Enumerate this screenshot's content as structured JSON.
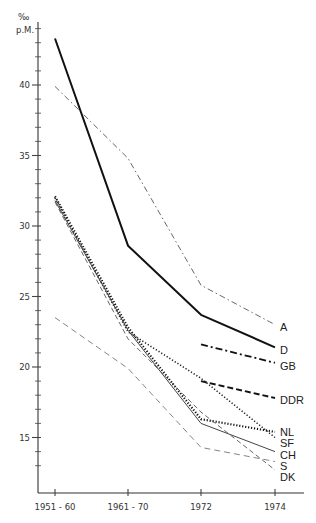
{
  "chart_data": {
    "type": "line",
    "title": "",
    "ylabel": "‰ p.M.",
    "ylabel_line1": "‰",
    "ylabel_line2": "p.M.",
    "xlabel": "",
    "categories": [
      "1951 - 60",
      "1961 - 70",
      "1972",
      "1974"
    ],
    "ylim": [
      11.7,
      46.5
    ],
    "yticks_major": [
      15,
      20,
      25,
      30,
      35,
      40
    ],
    "ytick_minor_step": 1,
    "grid": false,
    "legend_position": "right-end labels",
    "series": [
      {
        "name": "A",
        "style": "dash-dot-thin",
        "values": [
          39.9,
          34.8,
          25.8,
          23.0
        ]
      },
      {
        "name": "D",
        "style": "solid-thick",
        "values": [
          43.3,
          28.6,
          23.7,
          21.4
        ]
      },
      {
        "name": "GB",
        "style": "dash-dot-thick",
        "values": [
          null,
          null,
          21.6,
          20.3
        ]
      },
      {
        "name": "DDR",
        "style": "dashed-thick",
        "values": [
          null,
          null,
          19.0,
          17.8
        ]
      },
      {
        "name": "NL",
        "style": "dotted-thick",
        "values": [
          32.1,
          22.8,
          16.3,
          15.4
        ]
      },
      {
        "name": "SF",
        "style": "dotted",
        "values": [
          32.0,
          22.5,
          19.2,
          15.0
        ]
      },
      {
        "name": "CH",
        "style": "solid-thin",
        "values": [
          31.8,
          22.6,
          16.0,
          14.0
        ]
      },
      {
        "name": "S",
        "style": "dashed-thin",
        "values": [
          31.7,
          22.0,
          16.8,
          12.7
        ]
      },
      {
        "name": "DK",
        "style": "dashed-light",
        "values": [
          23.5,
          19.9,
          14.3,
          13.3
        ]
      }
    ]
  },
  "axis": {
    "y_unit_top": "‰",
    "y_unit_bottom": "p.M.",
    "y_tick_labels": [
      "40",
      "35",
      "30",
      "25",
      "20",
      "15"
    ],
    "x_tick_labels": [
      "1951 - 60",
      "1961 - 70",
      "1972",
      "1974"
    ]
  },
  "end_labels": [
    "A",
    "D",
    "GB",
    "DDR",
    "NL",
    "SF",
    "CH",
    "S",
    "DK"
  ]
}
